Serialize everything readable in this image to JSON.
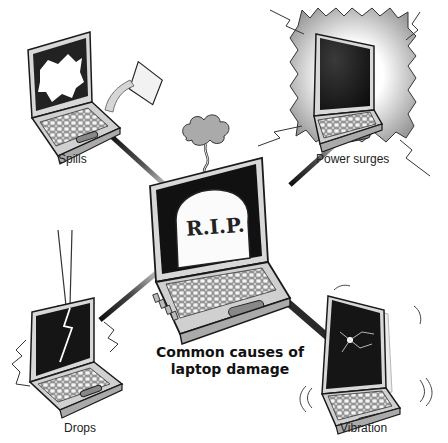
{
  "title": {
    "line1": "Common causes of",
    "line2": "laptop damage"
  },
  "center": {
    "screen_text": "R.I.P.",
    "icon": "tombstone-smoke"
  },
  "causes": [
    {
      "label": "Spills",
      "icon": "spilled-cup-laptop"
    },
    {
      "label": "Power surges",
      "icon": "lightning-laptop"
    },
    {
      "label": "Drops",
      "icon": "arrow-cracked-laptop"
    },
    {
      "label": "Vibration",
      "icon": "shaking-laptop"
    }
  ],
  "colors": {
    "outline": "#1a1a1a",
    "body": "#d0d0d0",
    "screen": "#151515",
    "connector": "#2a2a2a"
  }
}
